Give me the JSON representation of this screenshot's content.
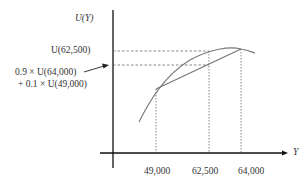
{
  "diagram": {
    "type": "expected-utility-concave-curve",
    "y_axis_label": "U(Y)",
    "x_axis_label": "Y",
    "y_labels": {
      "u_62500": "U(62,500)",
      "weighted_line1": "0.9 × U(64,000)",
      "weighted_line2": "+ 0.1 × U(49,000)"
    },
    "x_ticks": [
      "49,000",
      "62,500",
      "64,000"
    ],
    "colors": {
      "axis": "#111111",
      "curve": "#777777",
      "dashed": "#555555"
    }
  }
}
